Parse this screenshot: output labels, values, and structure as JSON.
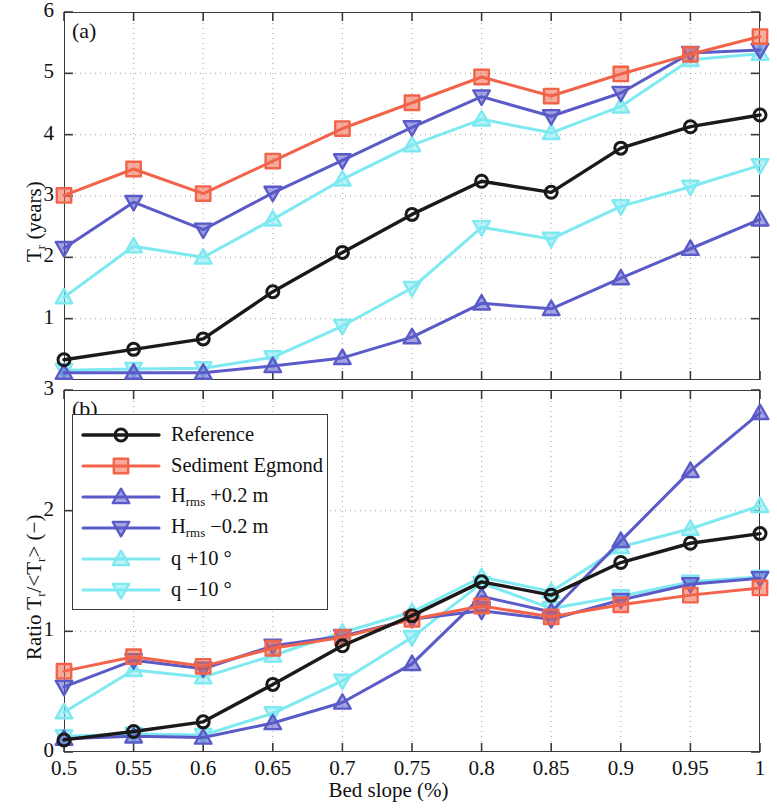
{
  "figure": {
    "panel_a_tag": "(a)",
    "panel_b_tag": "(b)",
    "xlabel": "Bed slope (%)",
    "ylabel_a": "T",
    "ylabel_a_sub": "r",
    "ylabel_a_rest": " (years)",
    "ylabel_b_pre": "Ratio T",
    "ylabel_b_sub1": "r",
    "ylabel_b_mid": "/<T",
    "ylabel_b_sub2": "r",
    "ylabel_b_post": "> (−)"
  },
  "colors": {
    "reference": "#1a1a1a",
    "sediment_egmond": "#f2644a",
    "hrms_plus": "#5a5ac8",
    "hrms_minus": "#5a5ac8",
    "q_plus": "#7fe9f2",
    "q_minus": "#7fe9f2",
    "axis": "#3a3a3a",
    "grid": "#9a9a9a"
  },
  "legend": {
    "items": [
      {
        "label": "Reference",
        "color": "#1a1a1a",
        "marker": "circle"
      },
      {
        "label": "Sediment Egmond",
        "color": "#f2644a",
        "marker": "square"
      },
      {
        "label": "H",
        "sub": "rms",
        "suffix": " +0.2 m",
        "color": "#5a5ac8",
        "marker": "triangle-up"
      },
      {
        "label": "H",
        "sub": "rms",
        "suffix": " −0.2 m",
        "color": "#5a5ac8",
        "marker": "triangle-down"
      },
      {
        "label": "q +10 °",
        "color": "#7fe9f2",
        "marker": "triangle-up"
      },
      {
        "label": "q −10 °",
        "color": "#7fe9f2",
        "marker": "triangle-down"
      }
    ]
  },
  "chart_data": [
    {
      "type": "line",
      "panel": "a",
      "title": "(a)",
      "xlabel": "Bed slope (%)",
      "ylabel": "T_r (years)",
      "x": [
        0.5,
        0.55,
        0.6,
        0.65,
        0.7,
        0.75,
        0.8,
        0.85,
        0.9,
        0.95,
        1.0
      ],
      "xticklabels": [
        "0.5",
        "0.55",
        "0.6",
        "0.65",
        "0.7",
        "0.75",
        "0.8",
        "0.85",
        "0.9",
        "0.95",
        "1"
      ],
      "yticks": [
        1,
        2,
        3,
        4,
        5,
        6
      ],
      "yticklabels": [
        "1",
        "2",
        "3",
        "4",
        "5",
        "6"
      ],
      "xlim": [
        0.5,
        1.0
      ],
      "ylim": [
        0.0,
        6.0
      ],
      "grid": true,
      "series": [
        {
          "name": "Reference",
          "marker": "circle",
          "color": "#1a1a1a",
          "values": [
            0.33,
            0.5,
            0.67,
            1.44,
            2.08,
            2.7,
            3.24,
            3.06,
            3.78,
            4.13,
            4.32
          ]
        },
        {
          "name": "Sediment Egmond",
          "marker": "square",
          "color": "#f2644a",
          "values": [
            3.01,
            3.44,
            3.04,
            3.57,
            4.1,
            4.52,
            4.94,
            4.63,
            4.99,
            5.31,
            5.6
          ]
        },
        {
          "name": "H_rms +0.2 m",
          "marker": "triangle-up",
          "color": "#5a5ac8",
          "values": [
            0.12,
            0.12,
            0.12,
            0.23,
            0.36,
            0.7,
            1.25,
            1.16,
            1.66,
            2.14,
            2.62
          ]
        },
        {
          "name": "H_rms -0.2 m",
          "marker": "triangle-down",
          "color": "#5a5ac8",
          "values": [
            2.15,
            2.9,
            2.45,
            3.05,
            3.58,
            4.12,
            4.62,
            4.3,
            4.68,
            5.33,
            5.38
          ]
        },
        {
          "name": "q +10 °",
          "marker": "triangle-up",
          "color": "#7fe9f2",
          "values": [
            1.35,
            2.18,
            2.0,
            2.62,
            3.27,
            3.83,
            4.25,
            4.03,
            4.46,
            5.22,
            5.32
          ]
        },
        {
          "name": "q −10 °",
          "marker": "triangle-down",
          "color": "#7fe9f2",
          "values": [
            0.16,
            0.18,
            0.19,
            0.37,
            0.88,
            1.5,
            2.49,
            2.3,
            2.83,
            3.15,
            3.5
          ]
        }
      ]
    },
    {
      "type": "line",
      "panel": "b",
      "title": "(b)",
      "xlabel": "Bed slope (%)",
      "ylabel": "Ratio T_r/<T_r> (-)",
      "x": [
        0.5,
        0.55,
        0.6,
        0.65,
        0.7,
        0.75,
        0.8,
        0.85,
        0.9,
        0.95,
        1.0
      ],
      "xticklabels": [
        "0.5",
        "0.55",
        "0.6",
        "0.65",
        "0.7",
        "0.75",
        "0.8",
        "0.85",
        "0.9",
        "0.95",
        "1"
      ],
      "yticks": [
        0,
        1,
        2,
        3
      ],
      "yticklabels": [
        "0",
        "1",
        "2",
        "3"
      ],
      "xlim": [
        0.5,
        1.0
      ],
      "ylim": [
        0.0,
        3.0
      ],
      "grid": true,
      "series": [
        {
          "name": "Reference",
          "marker": "circle",
          "color": "#1a1a1a",
          "values": [
            0.1,
            0.17,
            0.25,
            0.56,
            0.88,
            1.13,
            1.41,
            1.3,
            1.57,
            1.73,
            1.81
          ]
        },
        {
          "name": "Sediment Egmond",
          "marker": "square",
          "color": "#f2644a",
          "values": [
            0.67,
            0.79,
            0.71,
            0.86,
            0.95,
            1.1,
            1.21,
            1.12,
            1.22,
            1.3,
            1.36
          ]
        },
        {
          "name": "H_rms +0.2 m",
          "marker": "triangle-up",
          "color": "#5a5ac8",
          "values": [
            0.11,
            0.13,
            0.12,
            0.24,
            0.41,
            0.73,
            1.29,
            1.16,
            1.75,
            2.33,
            2.81
          ]
        },
        {
          "name": "H_rms -0.2 m",
          "marker": "triangle-down",
          "color": "#5a5ac8",
          "values": [
            0.54,
            0.76,
            0.69,
            0.88,
            0.96,
            1.1,
            1.17,
            1.1,
            1.26,
            1.39,
            1.44
          ]
        },
        {
          "name": "q +10 °",
          "marker": "triangle-up",
          "color": "#7fe9f2",
          "values": [
            0.33,
            0.68,
            0.62,
            0.8,
            0.99,
            1.16,
            1.45,
            1.33,
            1.7,
            1.85,
            2.04
          ]
        },
        {
          "name": "q −10 °",
          "marker": "triangle-down",
          "color": "#7fe9f2",
          "values": [
            0.13,
            0.15,
            0.14,
            0.32,
            0.59,
            0.95,
            1.4,
            1.19,
            1.29,
            1.41,
            1.45
          ]
        }
      ]
    }
  ]
}
